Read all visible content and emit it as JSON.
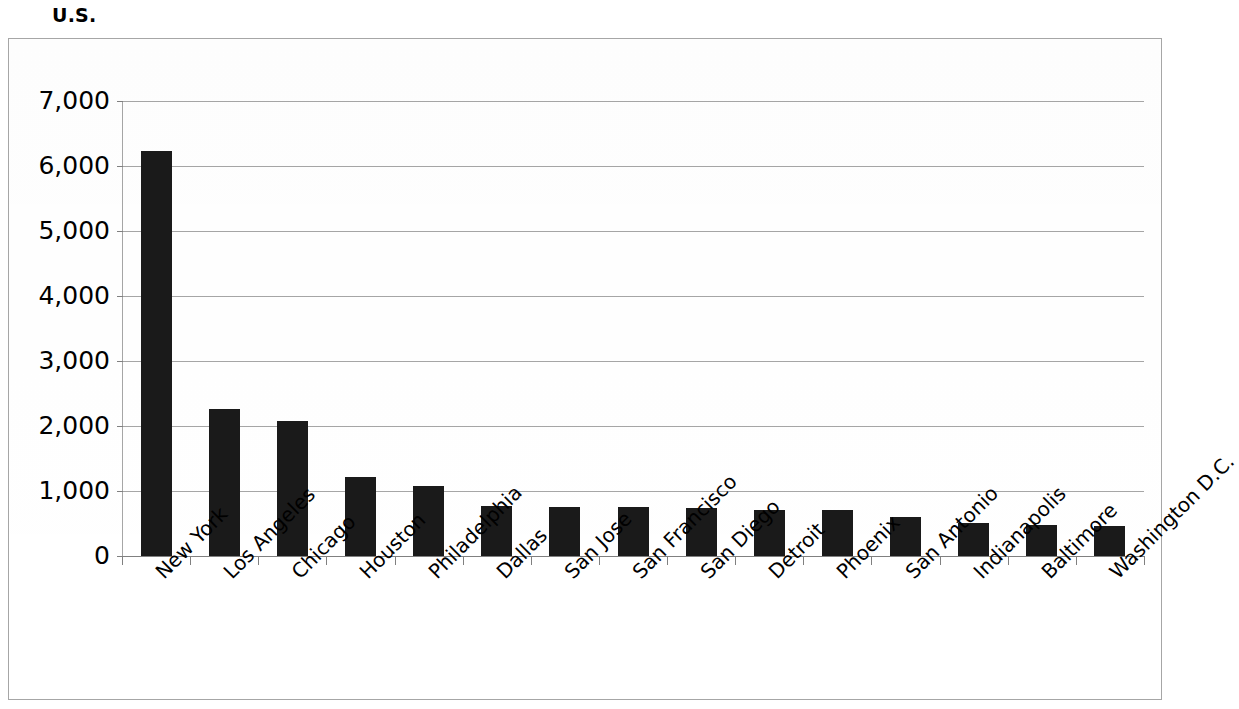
{
  "chart_data": {
    "type": "bar",
    "title": "U.S.",
    "xlabel": "",
    "ylabel": "",
    "ylim": [
      0,
      7000
    ],
    "ytick_step": 1000,
    "grid": true,
    "legend": false,
    "orientation": "vertical",
    "bar_color": "#1a1a1a",
    "categories": [
      "New York",
      "Los Angeles",
      "Chicago",
      "Houston",
      "Philadelphia",
      "Dallas",
      "San Jose",
      "San Francisco",
      "San Diego",
      "Detroit",
      "Phoenix",
      "San Antonio",
      "Indianapolis",
      "Baltimore",
      "Washington D.C."
    ],
    "values": [
      6230,
      2260,
      2080,
      1215,
      1070,
      770,
      760,
      755,
      735,
      715,
      710,
      600,
      510,
      475,
      465
    ],
    "ytick_labels": [
      "7,000",
      "6,000",
      "5,000",
      "4,000",
      "3,000",
      "2,000",
      "1,000",
      "0"
    ],
    "ytick_values": [
      7000,
      6000,
      5000,
      4000,
      3000,
      2000,
      1000,
      0
    ]
  },
  "colors": {
    "bar": "#1a1a1a",
    "gridline": "#a6a6a6",
    "frame": "#a6a6a6",
    "text": "#000000",
    "background": "#ffffff"
  }
}
